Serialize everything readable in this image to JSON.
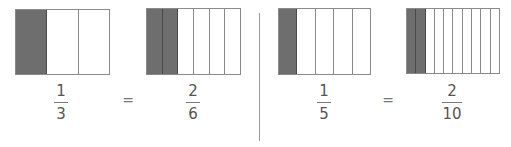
{
  "panels": [
    {
      "left": {
        "numerator": "1",
        "denominator": "3",
        "parts": 3,
        "shaded": 1
      },
      "equals": "=",
      "right": {
        "numerator": "2",
        "denominator": "6",
        "parts": 6,
        "shaded": 2
      }
    },
    {
      "left": {
        "numerator": "1",
        "denominator": "5",
        "parts": 5,
        "shaded": 1
      },
      "equals": "=",
      "right": {
        "numerator": "2",
        "denominator": "10",
        "parts": 10,
        "shaded": 2
      }
    }
  ],
  "colors": {
    "shaded": "#6e6e6e",
    "border": "#8a8a8a",
    "text": "#555555"
  }
}
